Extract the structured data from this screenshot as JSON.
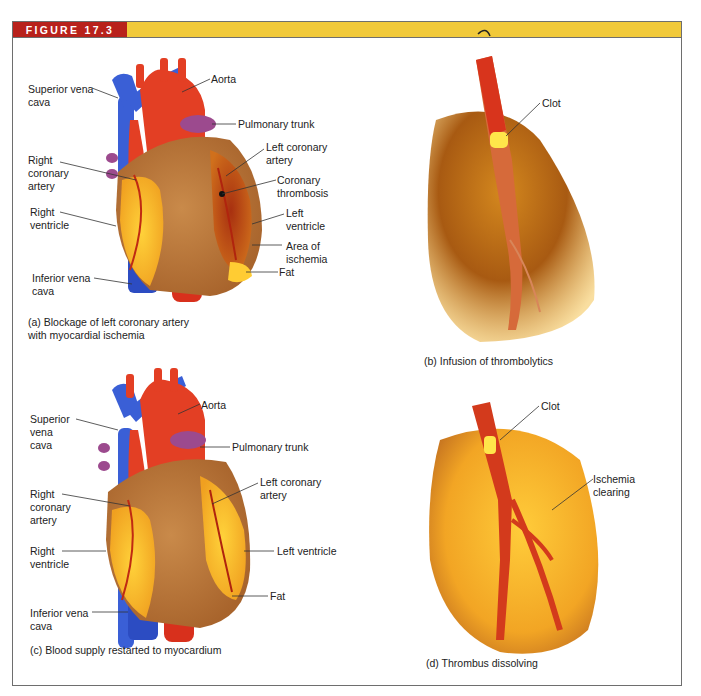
{
  "figure": {
    "number_label": "FIGURE 17.3",
    "header_colors": {
      "tag": "#b8211b",
      "bar": "#f1c93a"
    }
  },
  "panels": {
    "a": {
      "caption": "(a) Blockage of left coronary artery\n      with myocardial ischemia",
      "labels": {
        "superior_vena_cava": "Superior vena\ncava",
        "aorta": "Aorta",
        "pulmonary_trunk": "Pulmonary trunk",
        "right_coronary_artery": "Right\ncoronary\nartery",
        "left_coronary_artery": "Left coronary\nartery",
        "coronary_thrombosis": "Coronary\nthrombosis",
        "right_ventricle": "Right\nventricle",
        "left_ventricle": "Left\nventricle",
        "area_of_ischemia": "Area of\nischemia",
        "inferior_vena_cava": "Inferior vena\ncava",
        "fat": "Fat"
      }
    },
    "b": {
      "caption": "(b) Infusion of thrombolytics",
      "labels": {
        "clot": "Clot"
      }
    },
    "c": {
      "caption": "(c) Blood supply restarted to myocardium",
      "labels": {
        "superior_vena_cava": "Superior\nvena\ncava",
        "aorta": "Aorta",
        "pulmonary_trunk": "Pulmonary trunk",
        "right_coronary_artery": "Right\ncoronary\nartery",
        "left_coronary_artery": "Left coronary\nartery",
        "right_ventricle": "Right\nventricle",
        "left_ventricle": "Left ventricle",
        "inferior_vena_cava": "Inferior vena\ncava",
        "fat": "Fat"
      }
    },
    "d": {
      "caption": "(d) Thrombus dissolving",
      "labels": {
        "clot": "Clot",
        "ischemia_clearing": "Ischemia\nclearing"
      }
    }
  }
}
